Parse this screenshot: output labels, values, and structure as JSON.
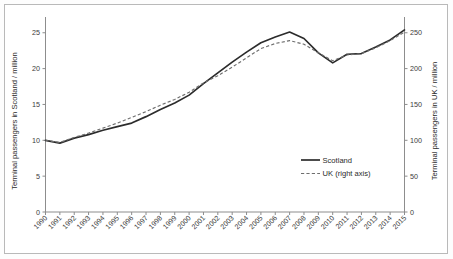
{
  "chart_data": {
    "type": "line",
    "title": "",
    "xlabel": "",
    "ylabel": "Terminal passengers in Scotland / million",
    "ylabel_right": "Terminal passengers in UK / million",
    "grid": false,
    "legend_position": "center-right",
    "x": [
      1990,
      1991,
      1992,
      1993,
      1994,
      1995,
      1996,
      1997,
      1998,
      1999,
      2000,
      2001,
      2002,
      2003,
      2004,
      2005,
      2006,
      2007,
      2008,
      2009,
      2010,
      2011,
      2012,
      2013,
      2014,
      2015
    ],
    "categories": [
      "1990",
      "1991",
      "1992",
      "1993",
      "1994",
      "1995",
      "1996",
      "1997",
      "1998",
      "1999",
      "2000",
      "2001",
      "2002",
      "2003",
      "2004",
      "2005",
      "2006",
      "2007",
      "2008",
      "2009",
      "2010",
      "2011",
      "2012",
      "2013",
      "2014",
      "2015"
    ],
    "ylim": [
      0,
      26.5
    ],
    "yticks": [
      0,
      5,
      10,
      15,
      20,
      25
    ],
    "ytick_labels": [
      "0",
      "5",
      "10",
      "15",
      "20",
      "25"
    ],
    "ylim_right": [
      0,
      265
    ],
    "yticks_right": [
      0,
      50,
      100,
      150,
      200,
      250
    ],
    "ytick_labels_right": [
      "0",
      "50",
      "100",
      "150",
      "200",
      "250"
    ],
    "series": [
      {
        "name": "Scotland",
        "axis": "left",
        "style": "solid",
        "color": "#2c2c2c",
        "values": [
          10.0,
          9.6,
          10.3,
          10.8,
          11.4,
          11.9,
          12.4,
          13.3,
          14.3,
          15.2,
          16.3,
          17.9,
          19.4,
          20.9,
          22.3,
          23.6,
          24.4,
          25.1,
          24.2,
          22.2,
          20.8,
          22.0,
          22.1,
          23.0,
          24.0,
          25.4
        ]
      },
      {
        "name": "UK (right axis)",
        "axis": "right",
        "style": "dashed",
        "color": "#6e6e6e",
        "values": [
          100,
          97,
          104,
          110,
          117,
          124,
          132,
          140,
          149,
          157,
          167,
          180,
          190,
          202,
          215,
          228,
          235,
          239,
          234,
          222,
          211,
          219,
          221,
          229,
          239,
          251
        ]
      }
    ],
    "legend": [
      {
        "label": "Scotland",
        "style": "solid"
      },
      {
        "label": "UK (right axis)",
        "style": "dashed"
      }
    ]
  }
}
